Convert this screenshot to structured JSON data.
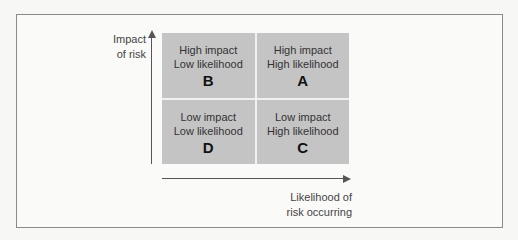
{
  "diagram": {
    "y_axis_label": [
      "Impact",
      "of risk"
    ],
    "x_axis_label": [
      "Likelihood of",
      "risk occurring"
    ],
    "quadrants": [
      {
        "position": "top-left",
        "line1": "High impact",
        "line2": "Low likelihood",
        "letter": "B"
      },
      {
        "position": "top-right",
        "line1": "High impact",
        "line2": "High likelihood",
        "letter": "A"
      },
      {
        "position": "bottom-left",
        "line1": "Low impact",
        "line2": "Low likelihood",
        "letter": "D"
      },
      {
        "position": "bottom-right",
        "line1": "Low impact",
        "line2": "High likelihood",
        "letter": "C"
      }
    ],
    "colors": {
      "cell": "#c4c4c4",
      "arrow": "#555555",
      "frame": "#8a8a8a"
    }
  }
}
